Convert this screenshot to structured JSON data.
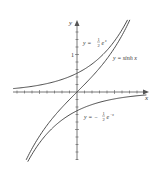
{
  "chart_data": {
    "type": "line",
    "title": "",
    "xlabel": "x",
    "ylabel": "y",
    "xlim": [
      -1.7,
      1.9
    ],
    "ylim": [
      -1.8,
      1.9
    ],
    "grid": false,
    "tick_labels": {
      "x": [
        "1"
      ],
      "y": [
        "1"
      ]
    },
    "x_tick_label": "1",
    "y_tick_label": "1",
    "series": [
      {
        "name": "y = ½e^x",
        "label_main": "y = ",
        "label_frac": "1",
        "label_den": "2",
        "label_tail": "e",
        "label_sup": "x",
        "function": "0.5*exp(x)"
      },
      {
        "name": "y = sinh x",
        "label": "y = sinh x",
        "function": "sinh(x)"
      },
      {
        "name": "y = −½e^−x",
        "label_main": "y = −",
        "label_frac": "1",
        "label_den": "2",
        "label_tail": "e",
        "label_sup": "−x",
        "function": "-0.5*exp(-x)"
      }
    ],
    "colors": {
      "curve": "#3a3a3a",
      "axis": "#555555"
    }
  }
}
